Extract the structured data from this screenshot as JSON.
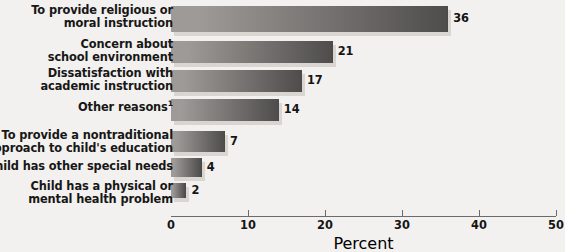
{
  "chart_data": {
    "type": "bar",
    "orientation": "horizontal",
    "title": "",
    "xlabel": "Percent",
    "ylabel": "",
    "xlim": [
      0,
      50
    ],
    "xticks": [
      0,
      10,
      20,
      30,
      40,
      50
    ],
    "xtick_labels": [
      "0",
      "10",
      "20",
      "30",
      "40",
      "50"
    ],
    "grid": false,
    "legend": null,
    "categories": [
      "To provide religious or\nmoral instruction",
      "Concern about\nschool environment",
      "Dissatisfaction with\nacademic instruction",
      "Other reasons",
      "To provide a nontraditional\napproach to child's education",
      "Child has other special needs",
      "Child has a physical or\nmental health problem"
    ],
    "values": [
      36,
      21,
      17,
      14,
      7,
      4,
      2
    ],
    "value_labels": [
      "36",
      "21",
      "17",
      "14",
      "7",
      "4",
      "2"
    ],
    "annotations": {
      "other_reasons_footnote_marker": "1"
    },
    "colors": {
      "bar_fill_light": "#9d9a97",
      "bar_fill_dark": "#4f4d4c",
      "bar_shadow": "#d9d6d2",
      "background": "#f3f1ef",
      "axis": "#6b6b6b",
      "text": "#151515"
    }
  },
  "axis": {
    "x_title": "Percent"
  }
}
